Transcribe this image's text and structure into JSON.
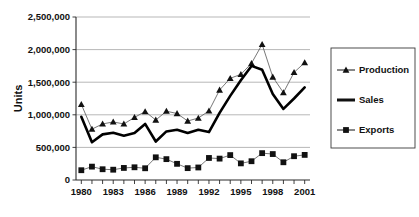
{
  "chart_data": {
    "type": "line",
    "title": "",
    "xlabel": "",
    "ylabel": "Units",
    "x": [
      1980,
      1981,
      1982,
      1983,
      1984,
      1985,
      1986,
      1987,
      1988,
      1989,
      1990,
      1991,
      1992,
      1993,
      1994,
      1995,
      1996,
      1997,
      1998,
      1999,
      2000,
      2001
    ],
    "xlim": [
      1979.5,
      2001.5
    ],
    "ylim": [
      0,
      2500000
    ],
    "y_ticks": [
      0,
      500000,
      1000000,
      1500000,
      2000000,
      2500000
    ],
    "y_tick_labels": [
      "0",
      "500,000",
      "1,000,000",
      "1,500,000",
      "2,000,000",
      "2,500,000"
    ],
    "x_tick_labels_shown": [
      "1980",
      "1983",
      "1986",
      "1989",
      "1992",
      "1995",
      "1998",
      "2001"
    ],
    "x_tick_years_shown": [
      1980,
      1983,
      1986,
      1989,
      1992,
      1995,
      1998,
      2001
    ],
    "grid": true,
    "grid_axis": "y",
    "legend_position": "right",
    "series": [
      {
        "name": "Production",
        "marker": "triangle",
        "line_style": "thin",
        "color": "#111111",
        "values": [
          1160000,
          780000,
          860000,
          890000,
          860000,
          960000,
          1050000,
          920000,
          1055000,
          1020000,
          905000,
          950000,
          1060000,
          1380000,
          1560000,
          1620000,
          1790000,
          2080000,
          1580000,
          1340000,
          1650000,
          1800000
        ]
      },
      {
        "name": "Sales",
        "marker": "none",
        "line_style": "thick",
        "color": "#000000",
        "values": [
          970000,
          580000,
          700000,
          725000,
          680000,
          720000,
          860000,
          590000,
          745000,
          770000,
          720000,
          770000,
          735000,
          1030000,
          1290000,
          1530000,
          1750000,
          1690000,
          1320000,
          1090000,
          1250000,
          1420000
        ]
      },
      {
        "name": "Exports",
        "marker": "square",
        "line_style": "thin",
        "color": "#111111",
        "values": [
          150000,
          205000,
          165000,
          158000,
          185000,
          195000,
          180000,
          348000,
          320000,
          248000,
          182000,
          192000,
          338000,
          328000,
          382000,
          255000,
          288000,
          412000,
          398000,
          272000,
          365000,
          385000
        ]
      }
    ]
  },
  "legend": {
    "items": [
      {
        "label": "Production"
      },
      {
        "label": "Sales"
      },
      {
        "label": "Exports"
      }
    ]
  },
  "axes": {
    "y_title": "Units"
  }
}
